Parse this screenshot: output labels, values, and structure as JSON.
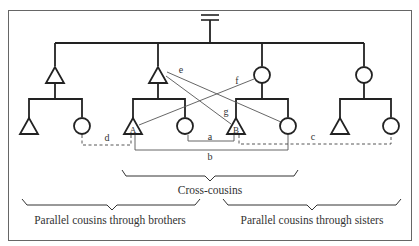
{
  "diagram": {
    "colors": {
      "line": "#222222",
      "thin": "#555555",
      "border": "#666666",
      "text": "#333333"
    },
    "marriage_symbol": "=",
    "ego_labels": {
      "A": "A",
      "B": "B"
    },
    "relation_labels": {
      "a": "a",
      "b": "b",
      "c": "c",
      "d": "d",
      "e": "e",
      "f": "f",
      "g": "g"
    },
    "brace_labels": {
      "cross": "Cross-cousins",
      "brothers": "Parallel cousins through brothers",
      "sisters": "Parallel cousins through sisters"
    }
  }
}
